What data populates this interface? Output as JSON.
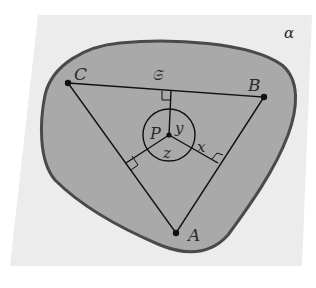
{
  "diagram": {
    "plane_label": "α",
    "region_label": "𝔖",
    "vertices": [
      {
        "name": "A",
        "x": 176,
        "y": 233
      },
      {
        "name": "B",
        "x": 264,
        "y": 97
      },
      {
        "name": "C",
        "x": 68,
        "y": 83
      }
    ],
    "point": {
      "name": "P",
      "x": 169,
      "y": 135
    },
    "distances": {
      "x": "x",
      "y": "y",
      "z": "z"
    },
    "colors": {
      "background": "#ffffff",
      "plane": "#ececec",
      "region_fill": "#a9a9a9",
      "region_border": "#4a4a4a",
      "lines": "#111111"
    }
  }
}
